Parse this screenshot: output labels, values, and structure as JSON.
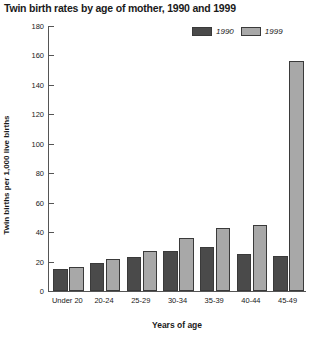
{
  "chart_data": {
    "type": "bar",
    "title": "Twin birth rates by age of mother, 1990 and 1999",
    "xlabel": "Years of age",
    "ylabel": "Twin births per 1,000 live births",
    "categories": [
      "Under 20",
      "20-24",
      "25-29",
      "30-34",
      "35-39",
      "40-44",
      "45-49"
    ],
    "series": [
      {
        "name": "1990",
        "color": "#4a4a4a",
        "values": [
          15,
          19,
          23,
          27,
          30,
          25,
          24
        ]
      },
      {
        "name": "1999",
        "color": "#a8a8a8",
        "values": [
          16,
          22,
          27,
          36,
          43,
          45,
          156
        ]
      }
    ],
    "ylim": [
      0,
      180
    ],
    "yticks": [
      0,
      20,
      40,
      60,
      80,
      100,
      120,
      140,
      160,
      180
    ],
    "ytick_labels": [
      "0",
      "20",
      "40",
      "60",
      "80",
      "100",
      "120",
      "140",
      "160",
      "180"
    ],
    "grid": false,
    "legend_position": "top-right",
    "legend_entries": [
      "1990",
      "1999"
    ]
  }
}
